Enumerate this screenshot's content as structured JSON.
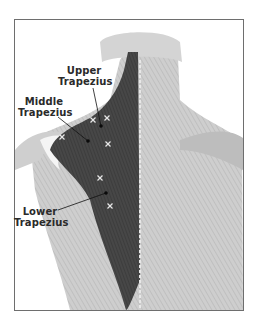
{
  "figure": {
    "colors": {
      "border": "#6e6e6e",
      "muscle_dark": "#3f3f3f",
      "muscle_mid": "#5a5a5a",
      "anatomy_light": "#c8c8c8",
      "background": "#ffffff",
      "marker_x": "#e6e6e6",
      "marker_dot": "#0a0a0a",
      "label_text": "#2a2a2a"
    }
  },
  "labels": [
    {
      "id": "upper",
      "line1": "Upper",
      "line2": "Trapezius"
    },
    {
      "id": "middle",
      "line1": "Middle",
      "line2": "Trapezius"
    },
    {
      "id": "lower",
      "line1": "Lower",
      "line2": "Trapezius"
    }
  ],
  "markers": {
    "trigger_points_x": [
      {
        "x": 93,
        "y": 120
      },
      {
        "x": 107,
        "y": 118
      },
      {
        "x": 62,
        "y": 137
      },
      {
        "x": 108,
        "y": 144
      },
      {
        "x": 100,
        "y": 178
      },
      {
        "x": 110,
        "y": 206
      }
    ],
    "leader_dots": [
      {
        "label": "upper",
        "x": 101,
        "y": 126
      },
      {
        "label": "middle",
        "x": 88,
        "y": 141
      },
      {
        "label": "lower",
        "x": 106,
        "y": 193
      }
    ],
    "x_glyph": "×"
  }
}
